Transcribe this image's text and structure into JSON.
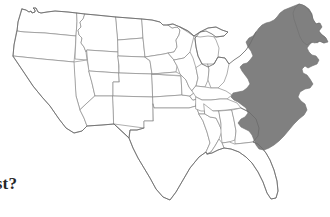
{
  "page": {
    "background_color": "#ffffff",
    "width": 330,
    "height": 217
  },
  "map": {
    "title": "United States outline map",
    "subject": "contiguous United States",
    "outline_color": "#8d8d8d",
    "fill_color": "#ffffff",
    "highlight_color": "#808080",
    "highlighted_region_name": "Northeast and Mid-Atlantic coastal states",
    "highlighted_states": [
      "Maine",
      "New Hampshire",
      "Vermont",
      "Massachusetts",
      "Rhode Island",
      "Connecticut",
      "New York",
      "New Jersey",
      "Pennsylvania",
      "Delaware",
      "Maryland",
      "Virginia",
      "West Virginia",
      "North Carolina",
      "South Carolina"
    ],
    "unhighlighted_notable_features": [
      "Great Lakes",
      "Florida peninsula",
      "Texas",
      "Pacific Northwest",
      "Gulf Coast"
    ]
  },
  "caption": {
    "text": "ast?",
    "full_text_guess": "ast?",
    "note": "text is cropped at the left edge of the image"
  }
}
